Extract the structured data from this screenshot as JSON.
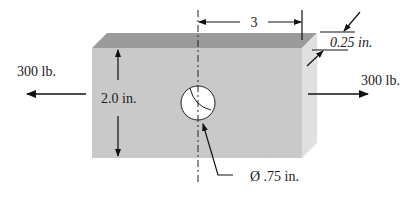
{
  "figure": {
    "colors": {
      "front_face": "#c9c9c9",
      "top_face": "#9b9b9b",
      "side_face": "#e0e0e0",
      "hole": "#ffffff",
      "line": "#111111",
      "background": "#ffffff"
    }
  },
  "labels": {
    "left_force": "300 lb.",
    "right_force": "300 lb.",
    "height": "2.0 in.",
    "distance_to_edge": "3",
    "thickness": "0.25 in.",
    "hole_diameter": "Ø .75 in."
  },
  "icons": {
    "left_arrow": "arrow-left",
    "right_arrow": "arrow-right",
    "dimension_arrows": "double-arrow",
    "centerline": "dash-dot-line"
  }
}
